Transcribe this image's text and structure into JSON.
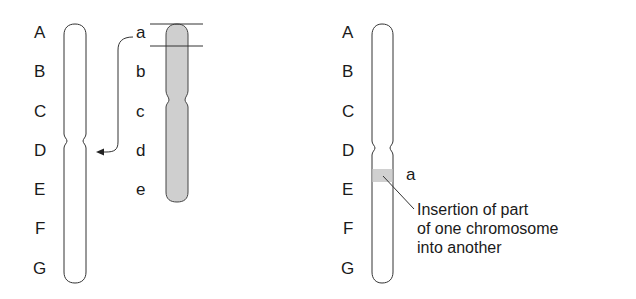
{
  "left_panel": {
    "chromosome_1": {
      "labels": [
        "A",
        "B",
        "C",
        "D",
        "E",
        "F",
        "G"
      ],
      "fill": "#ffffff"
    },
    "chromosome_2": {
      "labels": [
        "a",
        "b",
        "c",
        "d",
        "e"
      ],
      "fill": "#cfcfcf",
      "segment_marked": "a"
    },
    "arrow": {
      "from": "a",
      "to": "D"
    }
  },
  "right_panel": {
    "chromosome": {
      "labels": [
        "A",
        "B",
        "C",
        "D",
        "E",
        "F",
        "G"
      ],
      "fill": "#ffffff",
      "inserted_band_fill": "#d0d0d0"
    },
    "inserted_label": "a",
    "caption_lines": [
      "Insertion of part",
      "of one chromosome",
      "into another"
    ]
  }
}
